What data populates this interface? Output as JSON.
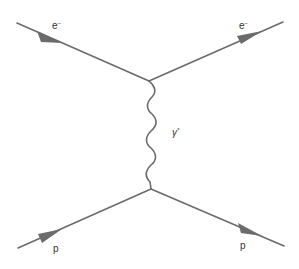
{
  "diagram": {
    "type": "feynman",
    "line_color": "#6b6b6b",
    "vertices": [
      {
        "id": "top",
        "x": 149,
        "y": 81
      },
      {
        "id": "bottom",
        "x": 151,
        "y": 189
      }
    ],
    "particles": {
      "incoming_electron": {
        "label": "e",
        "charge": "−"
      },
      "outgoing_electron": {
        "label": "e",
        "charge": "−"
      },
      "photon": {
        "label": "γ",
        "mark": "*"
      },
      "incoming_proton": {
        "label": "p"
      },
      "outgoing_proton": {
        "label": "p"
      }
    }
  }
}
